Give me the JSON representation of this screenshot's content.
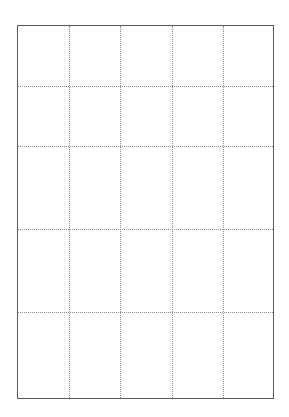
{
  "grid": {
    "columns": 5,
    "rows": 5,
    "frame": {
      "left": 17,
      "top": 25,
      "width": 257,
      "height": 374
    },
    "vertical_lines_x": [
      52,
      103,
      155,
      206
    ],
    "horizontal_lines_y": [
      61,
      121,
      204,
      287
    ],
    "colors": {
      "border": "#5a5a5a",
      "gridline": "#8a8a8a",
      "background": "#ffffff"
    },
    "border_style": "solid",
    "gridline_style": "dotted",
    "cells": [
      [
        "",
        "",
        "",
        "",
        ""
      ],
      [
        "",
        "",
        "",
        "",
        ""
      ],
      [
        "",
        "",
        "",
        "",
        ""
      ],
      [
        "",
        "",
        "",
        "",
        ""
      ],
      [
        "",
        "",
        "",
        "",
        ""
      ]
    ]
  }
}
